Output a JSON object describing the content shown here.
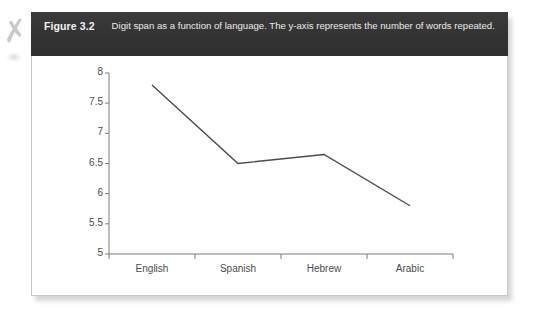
{
  "figure": {
    "label": "Figure 3.2",
    "caption": "Digit span as a function of language. The y-axis represents the number of words repeated."
  },
  "colors": {
    "caption_bar": "#363636",
    "caption_text": "#f2f2f2",
    "panel": "#ffffff",
    "line": "#4a4a4a",
    "axis": "#7d7d7d",
    "tick_text": "#4c4c4c"
  },
  "artifacts": {
    "scan_mark": "✗"
  },
  "chart_data": {
    "type": "line",
    "title": "",
    "xlabel": "",
    "ylabel": "",
    "categories": [
      "English",
      "Spanish",
      "Hebrew",
      "Arabic"
    ],
    "values": [
      7.8,
      6.5,
      6.65,
      5.8
    ],
    "ylim": [
      5,
      8
    ],
    "yticks": [
      5,
      5.5,
      6,
      6.5,
      7,
      7.5,
      8
    ],
    "ytick_labels": [
      "5",
      "5.5",
      "6",
      "6.5",
      "7",
      "7.5",
      "8"
    ],
    "grid": false,
    "legend": false,
    "series": [
      {
        "name": "Digit span",
        "values": [
          7.8,
          6.5,
          6.65,
          5.8
        ]
      }
    ]
  }
}
